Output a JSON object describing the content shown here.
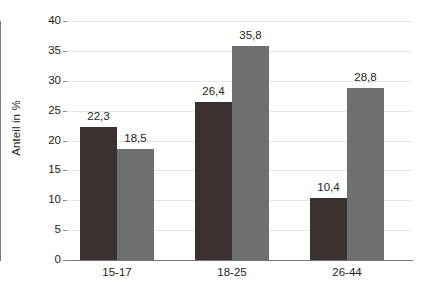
{
  "chart_data": {
    "type": "bar",
    "title": "",
    "subtitle": "",
    "xlabel": "",
    "ylabel": "Anteil in %",
    "categories": [
      "15-17",
      "18-25",
      "26-44"
    ],
    "series": [
      {
        "name": "Serie 1",
        "color": "#3b312f",
        "values": [
          22.3,
          26.4,
          10.4
        ],
        "labels": [
          "22,3",
          "26,4",
          "10,4"
        ]
      },
      {
        "name": "Serie 2",
        "color": "#6f6f6f",
        "values": [
          18.5,
          35.8,
          28.8
        ],
        "labels": [
          "18,5",
          "35,8",
          "28,8"
        ]
      }
    ],
    "ylim": [
      0,
      40
    ],
    "yticks": [
      0,
      5,
      10,
      15,
      20,
      25,
      30,
      35,
      40
    ],
    "ytick_labels": [
      "0",
      "5",
      "10",
      "15",
      "20",
      "25",
      "30",
      "35",
      "40"
    ],
    "grid": true,
    "legend": "none",
    "decimal_separator": ","
  },
  "axis": {
    "y_title": "Anteil in %"
  }
}
